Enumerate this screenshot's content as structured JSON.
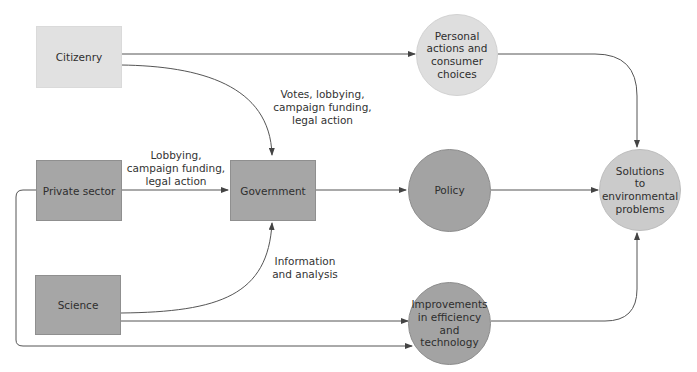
{
  "diagram": {
    "nodes": {
      "citizenry": {
        "label": "Citizenry",
        "shape": "box",
        "color": "#e1e1e1"
      },
      "private_sector": {
        "label": "Private sector",
        "shape": "box",
        "color": "#a6a6a6"
      },
      "science": {
        "label": "Science",
        "shape": "box",
        "color": "#a6a6a6"
      },
      "government": {
        "label": "Government",
        "shape": "box",
        "color": "#a6a6a6"
      },
      "personal_actions": {
        "label": "Personal\nactions and\nconsumer\nchoices",
        "shape": "circle",
        "color": "#dedede"
      },
      "policy": {
        "label": "Policy",
        "shape": "circle",
        "color": "#a3a3a3"
      },
      "improvements": {
        "label": "Improvements\nin efficiency\nand\ntechnology",
        "shape": "circle",
        "color": "#a3a3a3"
      },
      "solutions": {
        "label": "Solutions\nto\nenvironmental\nproblems",
        "shape": "circle",
        "color": "#cbcbcb"
      }
    },
    "edge_labels": {
      "citizenry_to_government": "Votes, lobbying,\ncampaign funding,\nlegal action",
      "private_to_government": "Lobbying,\ncampaign funding,\nlegal action",
      "science_to_government": "Information\nand analysis"
    },
    "edges": [
      {
        "from": "Citizenry",
        "to": "Personal actions and consumer choices"
      },
      {
        "from": "Citizenry",
        "to": "Government",
        "label": "Votes, lobbying, campaign funding, legal action"
      },
      {
        "from": "Private sector",
        "to": "Government",
        "label": "Lobbying, campaign funding, legal action"
      },
      {
        "from": "Science",
        "to": "Government",
        "label": "Information and analysis"
      },
      {
        "from": "Government",
        "to": "Policy"
      },
      {
        "from": "Policy",
        "to": "Solutions to environmental problems"
      },
      {
        "from": "Personal actions and consumer choices",
        "to": "Solutions to environmental problems"
      },
      {
        "from": "Science",
        "to": "Improvements in efficiency and technology"
      },
      {
        "from": "Private sector",
        "to": "Improvements in efficiency and technology"
      },
      {
        "from": "Improvements in efficiency and technology",
        "to": "Solutions to environmental problems"
      }
    ],
    "line_color": "#555555"
  }
}
